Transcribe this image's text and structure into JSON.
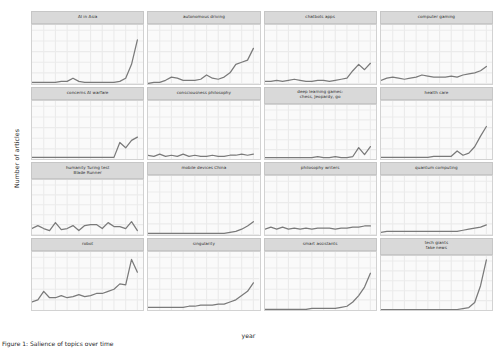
{
  "axes": {
    "ylabel": "Number of articles",
    "xlabel": "year",
    "yticks": [
      "0",
      "10",
      "20",
      "30",
      "40",
      "50"
    ],
    "xticks": [
      "2002",
      "2004",
      "2006",
      "2008",
      "2010",
      "2012",
      "2014",
      "2016",
      "2018"
    ]
  },
  "caption": "Figure 1: Salience of topics over time",
  "colors": {
    "line": "#7a7a7a",
    "strip_fill": "#d9d9d9",
    "panel_fill": "#fafafa",
    "grid": "#ebebeb",
    "axis_text": "#2e2e2e"
  },
  "chart_data": {
    "type": "line",
    "title": "",
    "xlabel": "year",
    "ylabel": "Number of articles",
    "ylim": [
      0,
      55
    ],
    "xlim": [
      2000,
      2019
    ],
    "grid": true,
    "legend": "none",
    "facet_layout": [
      4,
      4
    ],
    "x": [
      2000,
      2001,
      2002,
      2003,
      2004,
      2005,
      2006,
      2007,
      2008,
      2009,
      2010,
      2011,
      2012,
      2013,
      2014,
      2015,
      2016,
      2017,
      2018
    ],
    "panels": [
      {
        "label": "AI in Asia",
        "values": [
          1,
          1,
          1,
          1,
          1,
          2,
          2,
          5,
          2,
          1,
          1,
          1,
          1,
          1,
          1,
          2,
          5,
          18,
          41
        ]
      },
      {
        "label": "autonomous driving",
        "values": [
          0,
          1,
          1,
          3,
          6,
          5,
          3,
          3,
          3,
          4,
          8,
          5,
          4,
          6,
          10,
          18,
          20,
          22,
          33
        ]
      },
      {
        "label": "chatbots apps",
        "values": [
          2,
          2,
          3,
          2,
          3,
          4,
          3,
          2,
          2,
          3,
          3,
          2,
          3,
          4,
          5,
          12,
          18,
          13,
          19
        ]
      },
      {
        "label": "computer gaming",
        "values": [
          3,
          5,
          6,
          5,
          4,
          5,
          6,
          8,
          7,
          6,
          6,
          6,
          7,
          6,
          8,
          9,
          10,
          12,
          16
        ]
      },
      {
        "label": "concerns AI warfare",
        "values": [
          2,
          2,
          2,
          2,
          2,
          2,
          2,
          2,
          2,
          2,
          2,
          2,
          2,
          2,
          2,
          16,
          11,
          18,
          21
        ]
      },
      {
        "label": "consciousness philosophy",
        "values": [
          4,
          3,
          5,
          3,
          4,
          3,
          5,
          3,
          4,
          3,
          3,
          4,
          3,
          3,
          4,
          4,
          5,
          4,
          5
        ]
      },
      {
        "label": "deep learning games:\nchess, Jeopardy, go",
        "values": [
          2,
          2,
          2,
          2,
          2,
          2,
          2,
          2,
          2,
          3,
          2,
          2,
          3,
          2,
          2,
          3,
          12,
          5,
          13
        ]
      },
      {
        "label": "health care",
        "values": [
          2,
          2,
          2,
          2,
          2,
          2,
          2,
          2,
          2,
          3,
          3,
          3,
          3,
          8,
          4,
          6,
          12,
          22,
          31
        ]
      },
      {
        "label": "humanity Turing test\nBlade Runner",
        "values": [
          6,
          9,
          6,
          4,
          12,
          5,
          6,
          9,
          4,
          9,
          10,
          10,
          6,
          12,
          8,
          8,
          6,
          13,
          4
        ]
      },
      {
        "label": "mobile devices China",
        "values": [
          1,
          1,
          1,
          1,
          1,
          1,
          1,
          1,
          1,
          1,
          1,
          1,
          1,
          1,
          2,
          3,
          5,
          8,
          12
        ]
      },
      {
        "label": "philosophy writers",
        "values": [
          5,
          7,
          5,
          7,
          5,
          6,
          5,
          6,
          5,
          6,
          6,
          6,
          5,
          6,
          6,
          7,
          7,
          8,
          8
        ]
      },
      {
        "label": "quantum computing",
        "values": [
          2,
          3,
          3,
          3,
          3,
          3,
          3,
          3,
          3,
          3,
          3,
          3,
          3,
          3,
          4,
          5,
          6,
          7,
          9
        ]
      },
      {
        "label": "robot",
        "values": [
          8,
          10,
          18,
          12,
          12,
          14,
          12,
          13,
          15,
          13,
          14,
          16,
          16,
          18,
          20,
          25,
          24,
          48,
          36
        ]
      },
      {
        "label": "singularity",
        "values": [
          3,
          3,
          3,
          3,
          3,
          3,
          3,
          4,
          4,
          5,
          5,
          5,
          6,
          6,
          8,
          10,
          14,
          18,
          26
        ]
      },
      {
        "label": "smart assistants",
        "values": [
          1,
          1,
          1,
          1,
          1,
          1,
          1,
          1,
          2,
          2,
          2,
          2,
          2,
          3,
          4,
          8,
          14,
          22,
          35
        ]
      },
      {
        "label": "tech giants\nfake news",
        "values": [
          1,
          1,
          1,
          1,
          1,
          1,
          1,
          1,
          1,
          1,
          1,
          1,
          1,
          1,
          2,
          3,
          8,
          25,
          51
        ]
      }
    ]
  }
}
